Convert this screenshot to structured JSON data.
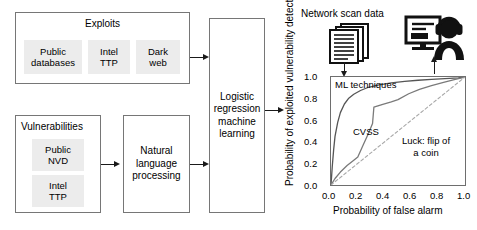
{
  "diagram": {
    "exploits_group": {
      "title": "Exploits",
      "sources": [
        {
          "label": "Public\ndatabases"
        },
        {
          "label": "Intel\nTTP"
        },
        {
          "label": "Dark\nweb"
        }
      ]
    },
    "vulnerabilities_group": {
      "title": "Vulnerabilities",
      "sources": [
        {
          "label": "Public\nNVD"
        },
        {
          "label": "Intel\nTTP"
        }
      ]
    },
    "nlp_box": {
      "label": "Natural\nlanguage\nprocessing"
    },
    "model_box": {
      "label": "Logistic\nregression\nmachine\nlearning"
    },
    "network_scan": {
      "caption": "Network scan data",
      "icon": "documents-stack-icon"
    },
    "analyst": {
      "icon": "analyst-monitor-headset-icon"
    }
  },
  "chart_data": {
    "type": "line",
    "title": "",
    "xlabel": "Probability of false alarm",
    "ylabel": "Probability of exploited vulnerability detection",
    "xlim": [
      0.0,
      1.0
    ],
    "ylim": [
      0.0,
      1.0
    ],
    "grid": false,
    "legend": "inline-annotations",
    "xticks": [
      "0.0",
      "0.2",
      "0.4",
      "0.6",
      "0.8",
      "1.0"
    ],
    "yticks": [
      "0.0",
      "0.2",
      "0.4",
      "0.6",
      "0.8",
      "1.0"
    ],
    "series": [
      {
        "name": "ML techniques",
        "style": "solid",
        "color": "#555555",
        "label_position": "top-left",
        "points": [
          [
            0.0,
            0.0
          ],
          [
            0.01,
            0.18
          ],
          [
            0.02,
            0.33
          ],
          [
            0.03,
            0.45
          ],
          [
            0.05,
            0.58
          ],
          [
            0.07,
            0.67
          ],
          [
            0.1,
            0.75
          ],
          [
            0.13,
            0.8
          ],
          [
            0.17,
            0.84
          ],
          [
            0.22,
            0.875
          ],
          [
            0.28,
            0.905
          ],
          [
            0.35,
            0.925
          ],
          [
            0.45,
            0.945
          ],
          [
            0.55,
            0.96
          ],
          [
            0.65,
            0.97
          ],
          [
            0.75,
            0.978
          ],
          [
            0.85,
            0.985
          ],
          [
            0.95,
            0.992
          ],
          [
            1.0,
            1.0
          ]
        ]
      },
      {
        "name": "CVSS",
        "style": "solid",
        "color": "#7a7a7a",
        "label_position": "mid-left",
        "points": [
          [
            0.0,
            0.0
          ],
          [
            0.03,
            0.06
          ],
          [
            0.07,
            0.12
          ],
          [
            0.12,
            0.18
          ],
          [
            0.17,
            0.23
          ],
          [
            0.2,
            0.26
          ],
          [
            0.24,
            0.37
          ],
          [
            0.28,
            0.48
          ],
          [
            0.31,
            0.57
          ],
          [
            0.32,
            0.72
          ],
          [
            0.38,
            0.745
          ],
          [
            0.45,
            0.77
          ],
          [
            0.5,
            0.79
          ],
          [
            0.58,
            0.845
          ],
          [
            0.66,
            0.885
          ],
          [
            0.75,
            0.92
          ],
          [
            0.84,
            0.95
          ],
          [
            0.92,
            0.975
          ],
          [
            1.0,
            1.0
          ]
        ]
      },
      {
        "name": "Luck: flip of a coin",
        "style": "dashed",
        "color": "#a8a8a8",
        "label_position": "mid-right",
        "points": [
          [
            0.0,
            0.0
          ],
          [
            1.0,
            1.0
          ]
        ]
      }
    ]
  }
}
